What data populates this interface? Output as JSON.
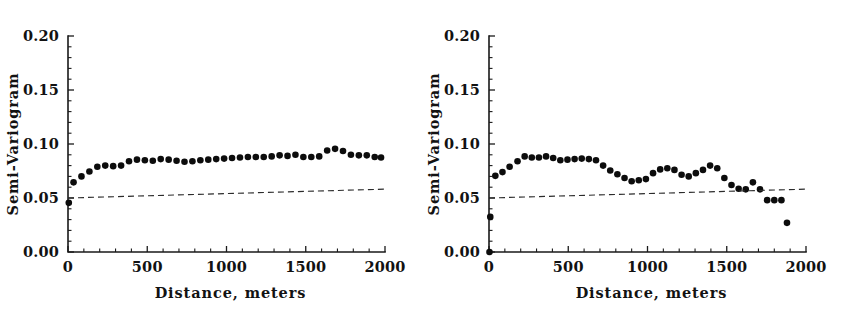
{
  "page": {
    "background": "#ffffff",
    "ink_color": "#121212"
  },
  "figures": [
    {
      "name": "left-panel",
      "chart_data": {
        "type": "scatter",
        "title": "",
        "xlabel": "Distance, meters",
        "ylabel": "Semi-Variogram",
        "xlim": [
          0,
          2000
        ],
        "ylim": [
          0.0,
          0.2
        ],
        "xticks": [
          0,
          500,
          1000,
          1500,
          2000
        ],
        "xtick_labels": [
          "0",
          "500",
          "1000",
          "1500",
          "2000"
        ],
        "xminor_ticks": [
          100,
          200,
          300,
          400,
          600,
          700,
          800,
          900,
          1100,
          1200,
          1300,
          1400,
          1600,
          1700,
          1800,
          1900
        ],
        "yticks": [
          0.0,
          0.05,
          0.1,
          0.15,
          0.2
        ],
        "ytick_labels": [
          "0.00",
          "0.05",
          "0.10",
          "0.15",
          "0.20"
        ],
        "yminor_ticks": [
          0.01,
          0.02,
          0.03,
          0.04,
          0.06,
          0.07,
          0.08,
          0.09,
          0.11,
          0.12,
          0.13,
          0.14,
          0.16,
          0.17,
          0.18,
          0.19
        ],
        "grid": false,
        "legend": "none",
        "series": [
          {
            "name": "Experimental semi-variogram",
            "marker": "filled-circle",
            "marker_size": 3.3,
            "color": "#0c0c0c",
            "x": [
              5,
              35,
              85,
              135,
              185,
              235,
              285,
              335,
              385,
              435,
              485,
              535,
              585,
              635,
              685,
              735,
              785,
              835,
              885,
              935,
              985,
              1035,
              1085,
              1135,
              1185,
              1235,
              1285,
              1335,
              1385,
              1435,
              1485,
              1535,
              1585,
              1635,
              1685,
              1735,
              1785,
              1835,
              1885,
              1935,
              1975
            ],
            "y": [
              0.0455,
              0.0645,
              0.07,
              0.0745,
              0.079,
              0.08,
              0.0795,
              0.08,
              0.084,
              0.0855,
              0.085,
              0.0845,
              0.086,
              0.0855,
              0.0845,
              0.0835,
              0.084,
              0.085,
              0.0855,
              0.086,
              0.0865,
              0.087,
              0.0875,
              0.088,
              0.088,
              0.088,
              0.0885,
              0.0895,
              0.089,
              0.09,
              0.088,
              0.088,
              0.0885,
              0.094,
              0.0955,
              0.0935,
              0.09,
              0.0895,
              0.0895,
              0.088,
              0.0875
            ]
          },
          {
            "name": "Fitted model (dashed)",
            "marker": "none",
            "style": "dashed",
            "color": "#2b2b2b",
            "x": [
              0,
              2000
            ],
            "y": [
              0.05,
              0.0582
            ]
          }
        ]
      }
    },
    {
      "name": "right-panel",
      "chart_data": {
        "type": "scatter",
        "title": "",
        "xlabel": "Distance, meters",
        "ylabel": "Semi-Variogram",
        "xlim": [
          0,
          2000
        ],
        "ylim": [
          0.0,
          0.2
        ],
        "xticks": [
          0,
          500,
          1000,
          1500,
          2000
        ],
        "xtick_labels": [
          "0",
          "500",
          "1000",
          "1500",
          "2000"
        ],
        "xminor_ticks": [
          100,
          200,
          300,
          400,
          600,
          700,
          800,
          900,
          1100,
          1200,
          1300,
          1400,
          1600,
          1700,
          1800,
          1900
        ],
        "yticks": [
          0.0,
          0.05,
          0.1,
          0.15,
          0.2
        ],
        "ytick_labels": [
          "0.00",
          "0.05",
          "0.10",
          "0.15",
          "0.20"
        ],
        "yminor_ticks": [
          0.01,
          0.02,
          0.03,
          0.04,
          0.06,
          0.07,
          0.08,
          0.09,
          0.11,
          0.12,
          0.13,
          0.14,
          0.16,
          0.17,
          0.18,
          0.19
        ],
        "grid": false,
        "legend": "none",
        "series": [
          {
            "name": "Experimental semi-variogram",
            "marker": "filled-circle",
            "marker_size": 3.3,
            "color": "#0c0c0c",
            "x": [
              3,
              8,
              40,
              85,
              130,
              180,
              225,
              270,
              315,
              360,
              405,
              450,
              495,
              540,
              585,
              630,
              675,
              720,
              765,
              810,
              855,
              900,
              945,
              990,
              1035,
              1080,
              1125,
              1170,
              1215,
              1260,
              1305,
              1350,
              1395,
              1440,
              1485,
              1530,
              1575,
              1620,
              1665,
              1710,
              1755,
              1800,
              1845,
              1880
            ],
            "y": [
              0.0,
              0.0325,
              0.0705,
              0.074,
              0.079,
              0.084,
              0.0885,
              0.0875,
              0.0875,
              0.0885,
              0.087,
              0.085,
              0.0855,
              0.086,
              0.0865,
              0.086,
              0.085,
              0.08,
              0.0755,
              0.072,
              0.0685,
              0.0655,
              0.0665,
              0.0675,
              0.073,
              0.0765,
              0.0775,
              0.076,
              0.0715,
              0.07,
              0.073,
              0.076,
              0.08,
              0.0775,
              0.0685,
              0.062,
              0.0585,
              0.058,
              0.0645,
              0.058,
              0.048,
              0.048,
              0.048,
              0.027
            ]
          },
          {
            "name": "Fitted model (dashed)",
            "marker": "none",
            "style": "dashed",
            "color": "#2b2b2b",
            "x": [
              0,
              2000
            ],
            "y": [
              0.05,
              0.0582
            ]
          }
        ]
      }
    }
  ]
}
